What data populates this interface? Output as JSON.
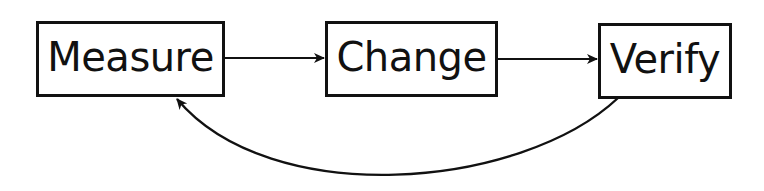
{
  "diagram": {
    "type": "cycle-flow",
    "nodes": [
      {
        "id": "measure",
        "label": "Measure",
        "x": 36,
        "y": 21,
        "w": 189,
        "h": 76
      },
      {
        "id": "change",
        "label": "Change",
        "x": 325,
        "y": 21,
        "w": 173,
        "h": 76
      },
      {
        "id": "verify",
        "label": "Verify",
        "x": 598,
        "y": 23,
        "w": 134,
        "h": 76
      }
    ],
    "edges": [
      {
        "from": "measure",
        "to": "change",
        "style": "straight"
      },
      {
        "from": "change",
        "to": "verify",
        "style": "straight"
      },
      {
        "from": "verify",
        "to": "measure",
        "style": "curved"
      }
    ],
    "colors": {
      "stroke": "#111111",
      "background": "#ffffff",
      "text": "#111111"
    }
  }
}
